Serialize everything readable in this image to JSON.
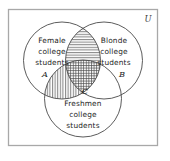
{
  "figure": {
    "type": "venn-diagram",
    "set_count": 3,
    "universe_label": "U",
    "stroke_color": "#4a4a4a",
    "border_color": "#a8a8a8",
    "background_color": "#ffffff",
    "text_color": "#1d1d1d"
  },
  "sets": {
    "a": {
      "letter": "A",
      "line1": "Female",
      "line2": "college",
      "line3": "students"
    },
    "b": {
      "letter": "B",
      "line1": "Blonde",
      "line2": "college",
      "line3": "students"
    },
    "c": {
      "letter": "C",
      "line1": "Freshmen",
      "line2": "college",
      "line3": "students"
    }
  },
  "shaded_regions": [
    {
      "region": "a-intersect-b",
      "pattern": "horizontal-lines"
    },
    {
      "region": "a-intersect-c",
      "pattern": "vertical-lines"
    },
    {
      "region": "a-intersect-b-intersect-c",
      "pattern": "cross-hatch"
    }
  ],
  "unshaded_regions": [
    {
      "region": "b-intersect-c",
      "pattern": "none"
    },
    {
      "region": "a-only",
      "pattern": "none"
    },
    {
      "region": "b-only",
      "pattern": "none"
    },
    {
      "region": "c-only",
      "pattern": "none"
    }
  ]
}
